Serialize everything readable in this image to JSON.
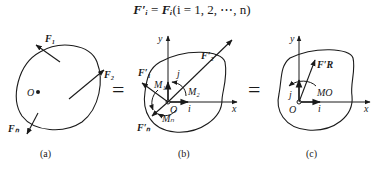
{
  "equation": {
    "lhs": "F′ᵢ",
    "equals": " = ",
    "rhs": "Fᵢ",
    "condition": "(i = 1, 2, ⋯, n)"
  },
  "panels": [
    {
      "caption": "(a)",
      "origin_label": "O",
      "forces": [
        "F₁",
        "F₂",
        "Fₙ"
      ]
    },
    {
      "caption": "(b)",
      "origin_label": "O",
      "axes": {
        "x": "x",
        "y": "y",
        "unit_x": "i",
        "unit_y": "j"
      },
      "forces": [
        "F′₁",
        "F′₂",
        "F′ₙ"
      ],
      "moments": [
        "M₁",
        "M₂",
        "Mₙ"
      ]
    },
    {
      "caption": "(c)",
      "origin_label": "O",
      "axes": {
        "x": "x",
        "y": "y",
        "unit_x": "i",
        "unit_y": "j"
      },
      "resultant_force": "F′R",
      "resultant_moment": "MO"
    }
  ],
  "separators": [
    "=",
    "="
  ]
}
